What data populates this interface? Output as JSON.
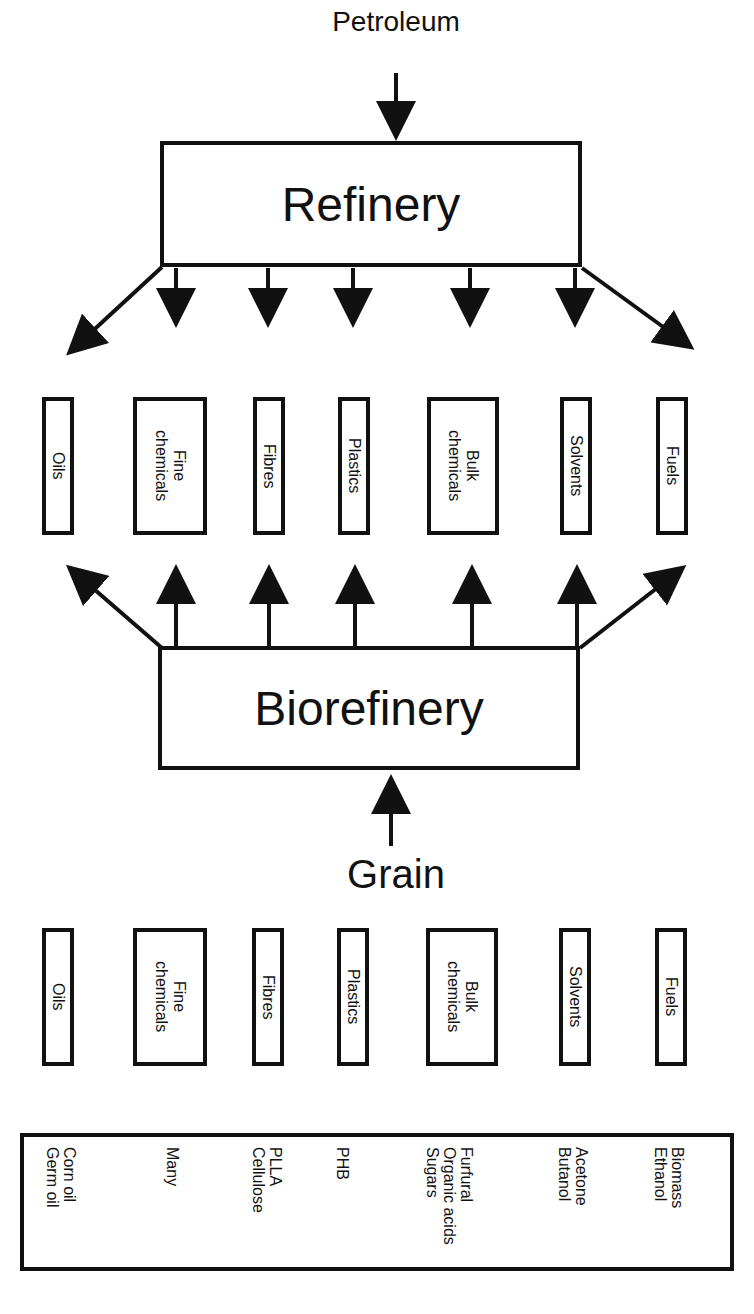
{
  "inputs": {
    "top": "Petroleum",
    "bottom": "Grain"
  },
  "processes": {
    "refinery": "Refinery",
    "biorefinery": "Biorefinery"
  },
  "products_top": [
    {
      "label": "Oils"
    },
    {
      "label": "Fine\nchemicals"
    },
    {
      "label": "Fibres"
    },
    {
      "label": "Plastics"
    },
    {
      "label": "Bulk\nchemicals"
    },
    {
      "label": "Solvents"
    },
    {
      "label": "Fuels"
    }
  ],
  "products_bottom": [
    {
      "label": "Oils"
    },
    {
      "label": "Fine\nchemicals"
    },
    {
      "label": "Fibres"
    },
    {
      "label": "Plastics"
    },
    {
      "label": "Bulk\nchemicals"
    },
    {
      "label": "Solvents"
    },
    {
      "label": "Fuels"
    }
  ],
  "examples": [
    {
      "category": "Oils",
      "text": "Corn oil\nGerm oil"
    },
    {
      "category": "Fine chemicals",
      "text": "Many"
    },
    {
      "category": "Fibres",
      "text": "PLLA\nCellulose"
    },
    {
      "category": "Plastics",
      "text": "PHB"
    },
    {
      "category": "Bulk chemicals",
      "text": "Furfural\nOrganic acids\nSugars"
    },
    {
      "category": "Solvents",
      "text": "Acetone\nButanol"
    },
    {
      "category": "Fuels",
      "text": "Biomass\nEthanol"
    }
  ],
  "colors": {
    "stroke": "#111111",
    "background": "#ffffff"
  }
}
